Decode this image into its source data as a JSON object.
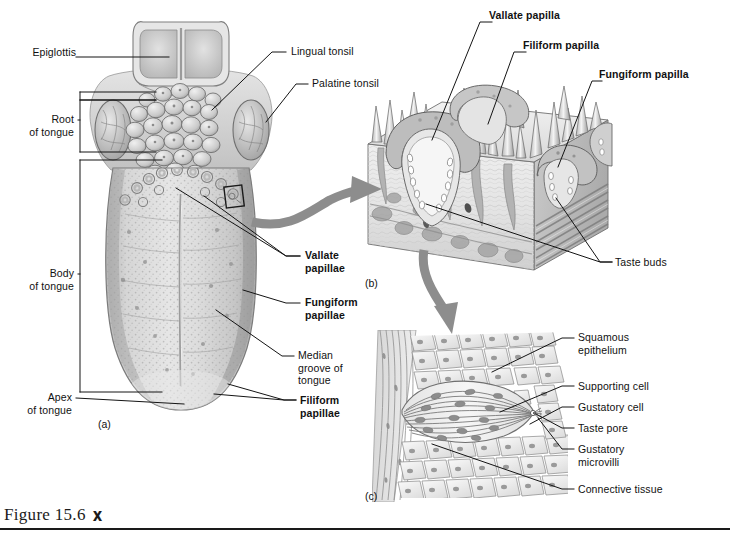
{
  "figure": {
    "caption": "Figure 15.6",
    "runner_icon": "running-figure-icon",
    "panel_tags": {
      "a": "(a)",
      "b": "(b)",
      "c": "(c)"
    }
  },
  "colors": {
    "ink": "#111111",
    "rule": "#1a1a1a",
    "arrow_gray": "#8a8a8a",
    "tissue_light": "#e9e9e9",
    "tissue_mid": "#c4c4c4",
    "tissue_dark": "#9a9a9a",
    "background": "#ffffff"
  },
  "panel_a": {
    "title_hidden": "",
    "labels": [
      {
        "id": "epiglottis",
        "text": "Epiglottis",
        "bold": false,
        "align": "right",
        "x": 30,
        "y": 52
      },
      {
        "id": "root-of-tongue",
        "text": "Root\nof tongue",
        "bold": false,
        "align": "right",
        "x": 26,
        "y": 115
      },
      {
        "id": "body-of-tongue",
        "text": "Body\nof tongue",
        "bold": false,
        "align": "right",
        "x": 26,
        "y": 268
      },
      {
        "id": "apex-of-tongue",
        "text": "Apex\nof tongue",
        "bold": false,
        "align": "right",
        "x": 30,
        "y": 392
      },
      {
        "id": "lingual-tonsil",
        "text": "Lingual tonsil",
        "bold": false,
        "align": "left",
        "x": 293,
        "y": 48
      },
      {
        "id": "palatine-tonsil",
        "text": "Palatine tonsil",
        "bold": false,
        "align": "left",
        "x": 312,
        "y": 80
      },
      {
        "id": "vallate-papillae",
        "text": "Vallate\npapillae",
        "bold": true,
        "align": "left",
        "x": 305,
        "y": 250
      },
      {
        "id": "fungiform-papillae",
        "text": "Fungiform\npapillae",
        "bold": true,
        "align": "left",
        "x": 305,
        "y": 297
      },
      {
        "id": "median-groove",
        "text": "Median\ngroove of\ntongue",
        "bold": false,
        "align": "left",
        "x": 298,
        "y": 350
      },
      {
        "id": "filiform-papillae",
        "text": "Filiform\npapillae",
        "bold": true,
        "align": "left",
        "x": 300,
        "y": 395
      }
    ]
  },
  "panel_b": {
    "labels": [
      {
        "id": "vallate-papilla",
        "text": "Vallate papilla",
        "bold": true,
        "align": "left",
        "x": 483,
        "y": 8
      },
      {
        "id": "filiform-papilla",
        "text": "Filiform papilla",
        "bold": true,
        "align": "left",
        "x": 517,
        "y": 39
      },
      {
        "id": "fungiform-papilla",
        "text": "Fungiform papilla",
        "bold": true,
        "align": "left",
        "x": 594,
        "y": 68
      },
      {
        "id": "taste-buds",
        "text": "Taste buds",
        "bold": false,
        "align": "left",
        "x": 616,
        "y": 258
      }
    ]
  },
  "panel_c": {
    "labels": [
      {
        "id": "squamous-epithelium",
        "text": "Squamous\nepithelium",
        "bold": false,
        "align": "left",
        "x": 578,
        "y": 330
      },
      {
        "id": "supporting-cell",
        "text": "Supporting cell",
        "bold": false,
        "align": "left",
        "x": 578,
        "y": 380
      },
      {
        "id": "gustatory-cell",
        "text": "Gustatory cell",
        "bold": false,
        "align": "left",
        "x": 578,
        "y": 401
      },
      {
        "id": "taste-pore",
        "text": "Taste pore",
        "bold": false,
        "align": "left",
        "x": 578,
        "y": 422
      },
      {
        "id": "gustatory-microvilli",
        "text": "Gustatory\nmicrovilli",
        "bold": false,
        "align": "left",
        "x": 578,
        "y": 442
      },
      {
        "id": "connective-tissue",
        "text": "Connective tissue",
        "bold": false,
        "align": "left",
        "x": 578,
        "y": 483
      }
    ]
  }
}
